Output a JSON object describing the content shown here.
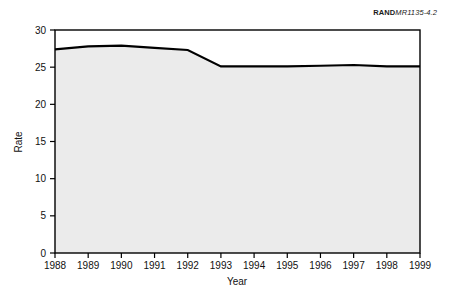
{
  "figure_label": {
    "mark": "RAND",
    "number": "MR1135-4.2"
  },
  "colors": {
    "line": "#000000",
    "area_fill": "#ebebeb",
    "frame": "#000000",
    "text": "#111111",
    "background": "#ffffff"
  },
  "chart_data": {
    "type": "area",
    "title": "",
    "subtitle": "",
    "xlabel": "Year",
    "ylabel": "Rate",
    "x": [
      1988,
      1989,
      1990,
      1991,
      1992,
      1993,
      1994,
      1995,
      1996,
      1997,
      1998,
      1999
    ],
    "categories": [
      "1988",
      "1989",
      "1990",
      "1991",
      "1992",
      "1993",
      "1994",
      "1995",
      "1996",
      "1997",
      "1998",
      "1999"
    ],
    "values": [
      27.4,
      27.8,
      27.9,
      27.6,
      27.3,
      25.1,
      25.1,
      25.1,
      25.2,
      25.3,
      25.1,
      25.1
    ],
    "series": [
      {
        "name": "Rate",
        "values": [
          27.4,
          27.8,
          27.9,
          27.6,
          27.3,
          25.1,
          25.1,
          25.1,
          25.2,
          25.3,
          25.1,
          25.1
        ]
      }
    ],
    "xlim": [
      1988,
      1999
    ],
    "ylim": [
      0,
      30
    ],
    "yticks": [
      0,
      5,
      10,
      15,
      20,
      25,
      30
    ],
    "ytick_labels": [
      "0",
      "5",
      "10",
      "15",
      "20",
      "25",
      "30"
    ],
    "xticks": [
      1988,
      1989,
      1990,
      1991,
      1992,
      1993,
      1994,
      1995,
      1996,
      1997,
      1998,
      1999
    ],
    "xtick_labels": [
      "1988",
      "1989",
      "1990",
      "1991",
      "1992",
      "1993",
      "1994",
      "1995",
      "1996",
      "1997",
      "1998",
      "1999"
    ],
    "grid": false,
    "legend": false,
    "legend_position": "none",
    "annotations": []
  }
}
